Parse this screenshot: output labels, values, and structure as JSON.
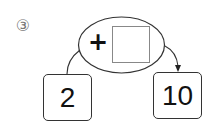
{
  "problem": {
    "number_label": "③",
    "operator": "+",
    "answer_blank": "",
    "start_value": "2",
    "result_value": "10"
  },
  "colors": {
    "stroke": "#333333",
    "label": "#777777",
    "blank_border": "#888888"
  }
}
